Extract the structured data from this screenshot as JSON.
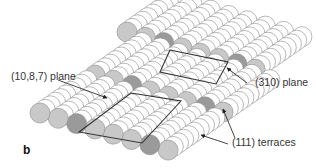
{
  "figure": {
    "panel_letter": "b",
    "labels": {
      "plane_10_8_7": "(10,8,7)  plane",
      "plane_310": "(310)  plane",
      "terraces_111": "(111)  terraces"
    },
    "colors": {
      "background": "#ffffff",
      "edge_atom": "#c8c8c8",
      "marked_atom": "#9a9a9a",
      "terrace_atom": "#ffffff",
      "atom_stroke": "#8a8a8a",
      "plane_outline": "#333333",
      "arrow": "#333333"
    },
    "terraces": [
      {
        "name": "upper-terrace",
        "edge_start": [
          127,
          32
        ],
        "atom_count": 8,
        "marked_atoms": [
          2,
          6
        ]
      },
      {
        "name": "middle-terrace",
        "edge_start": [
          95,
          75
        ],
        "atom_count": 8,
        "marked_atoms": [
          2,
          6
        ]
      },
      {
        "name": "lower-terrace",
        "edge_start": [
          40,
          113
        ],
        "atom_count": 8,
        "marked_atoms": [
          2,
          6
        ]
      }
    ],
    "planes": [
      {
        "name": "plane-310",
        "points": [
          [
            170,
            50
          ],
          [
            228,
            62
          ],
          [
            216,
            84
          ],
          [
            160,
            72
          ]
        ]
      },
      {
        "name": "plane-10-8-7",
        "points": [
          [
            131,
            93
          ],
          [
            181,
            101
          ],
          [
            142,
            143
          ],
          [
            79,
            132
          ]
        ]
      }
    ]
  }
}
